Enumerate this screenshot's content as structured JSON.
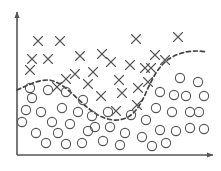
{
  "figure": {
    "width": 221,
    "height": 171,
    "background_color": "#ffffff"
  },
  "axes": {
    "name": "two-axis-frame",
    "color": "#555555",
    "line_width": 1.6,
    "origin": {
      "x": 17,
      "y": 155
    },
    "x_axis": {
      "label": "",
      "from": {
        "x": 17,
        "y": 155
      },
      "to": {
        "x": 213,
        "y": 155
      },
      "arrow_head": true,
      "tick_labels": []
    },
    "y_axis": {
      "label": "",
      "from": {
        "x": 17,
        "y": 155
      },
      "to": {
        "x": 17,
        "y": 12
      },
      "arrow_head": true,
      "tick_labels": []
    }
  },
  "chart_data": {
    "type": "scatter",
    "title": "",
    "subtitle": "",
    "xlabel": "",
    "ylabel": "",
    "xlim": [
      17,
      213
    ],
    "ylim": [
      155,
      12
    ],
    "grid": false,
    "legend": null,
    "legend_position": "none",
    "annotations": [],
    "marker_color": "#555555",
    "marker_line_width": 1.1,
    "cross_size": 9,
    "circle_radius": 4.6,
    "series": [
      {
        "name": "Class X",
        "marker": "cross",
        "color": "#555555",
        "count": 27,
        "points": [
          {
            "x": 38,
            "y": 41
          },
          {
            "x": 60,
            "y": 41
          },
          {
            "x": 136,
            "y": 39
          },
          {
            "x": 178,
            "y": 37
          },
          {
            "x": 32,
            "y": 59
          },
          {
            "x": 48,
            "y": 59
          },
          {
            "x": 80,
            "y": 56
          },
          {
            "x": 102,
            "y": 54
          },
          {
            "x": 155,
            "y": 55
          },
          {
            "x": 30,
            "y": 70
          },
          {
            "x": 75,
            "y": 74
          },
          {
            "x": 93,
            "y": 72
          },
          {
            "x": 130,
            "y": 65
          },
          {
            "x": 145,
            "y": 68
          },
          {
            "x": 151,
            "y": 68
          },
          {
            "x": 119,
            "y": 80
          },
          {
            "x": 138,
            "y": 88
          },
          {
            "x": 101,
            "y": 96
          },
          {
            "x": 116,
            "y": 111
          },
          {
            "x": 137,
            "y": 105
          },
          {
            "x": 66,
            "y": 79
          },
          {
            "x": 88,
            "y": 84
          },
          {
            "x": 57,
            "y": 87
          },
          {
            "x": 122,
            "y": 93
          },
          {
            "x": 148,
            "y": 82
          },
          {
            "x": 165,
            "y": 60
          },
          {
            "x": 111,
            "y": 62
          }
        ]
      },
      {
        "name": "Class O",
        "marker": "circle",
        "color": "#555555",
        "count": 44,
        "points": [
          {
            "x": 32,
            "y": 98
          },
          {
            "x": 48,
            "y": 90
          },
          {
            "x": 66,
            "y": 92
          },
          {
            "x": 83,
            "y": 100
          },
          {
            "x": 26,
            "y": 110
          },
          {
            "x": 41,
            "y": 112
          },
          {
            "x": 62,
            "y": 108
          },
          {
            "x": 78,
            "y": 112
          },
          {
            "x": 22,
            "y": 122
          },
          {
            "x": 52,
            "y": 122
          },
          {
            "x": 70,
            "y": 124
          },
          {
            "x": 92,
            "y": 116
          },
          {
            "x": 36,
            "y": 133
          },
          {
            "x": 58,
            "y": 133
          },
          {
            "x": 88,
            "y": 131
          },
          {
            "x": 46,
            "y": 143
          },
          {
            "x": 66,
            "y": 144
          },
          {
            "x": 82,
            "y": 143
          },
          {
            "x": 103,
            "y": 141
          },
          {
            "x": 110,
            "y": 127
          },
          {
            "x": 125,
            "y": 133
          },
          {
            "x": 120,
            "y": 145
          },
          {
            "x": 142,
            "y": 137
          },
          {
            "x": 146,
            "y": 120
          },
          {
            "x": 160,
            "y": 130
          },
          {
            "x": 156,
            "y": 108
          },
          {
            "x": 172,
            "y": 112
          },
          {
            "x": 176,
            "y": 131
          },
          {
            "x": 190,
            "y": 128
          },
          {
            "x": 199,
            "y": 112
          },
          {
            "x": 204,
            "y": 129
          },
          {
            "x": 166,
            "y": 143
          },
          {
            "x": 186,
            "y": 96
          },
          {
            "x": 198,
            "y": 82
          },
          {
            "x": 180,
            "y": 78
          },
          {
            "x": 174,
            "y": 95
          },
          {
            "x": 160,
            "y": 92
          },
          {
            "x": 190,
            "y": 112
          },
          {
            "x": 131,
            "y": 115
          },
          {
            "x": 152,
            "y": 146
          },
          {
            "x": 108,
            "y": 112
          },
          {
            "x": 95,
            "y": 127
          },
          {
            "x": 30,
            "y": 88
          },
          {
            "x": 204,
            "y": 96
          }
        ]
      }
    ],
    "decision_boundary": {
      "name": "decision-boundary-curve",
      "style": "dashed",
      "color": "#444444",
      "line_width": 1.7,
      "dash_pattern": "4,3",
      "path_points": [
        {
          "x": 17,
          "y": 90
        },
        {
          "x": 26,
          "y": 86
        },
        {
          "x": 36,
          "y": 82
        },
        {
          "x": 48,
          "y": 80
        },
        {
          "x": 58,
          "y": 83
        },
        {
          "x": 68,
          "y": 90
        },
        {
          "x": 78,
          "y": 99
        },
        {
          "x": 88,
          "y": 108
        },
        {
          "x": 98,
          "y": 115
        },
        {
          "x": 108,
          "y": 119
        },
        {
          "x": 118,
          "y": 120
        },
        {
          "x": 128,
          "y": 117
        },
        {
          "x": 136,
          "y": 110
        },
        {
          "x": 143,
          "y": 99
        },
        {
          "x": 149,
          "y": 86
        },
        {
          "x": 156,
          "y": 73
        },
        {
          "x": 164,
          "y": 63
        },
        {
          "x": 174,
          "y": 56
        },
        {
          "x": 186,
          "y": 52
        },
        {
          "x": 197,
          "y": 51
        },
        {
          "x": 207,
          "y": 52
        }
      ]
    }
  }
}
